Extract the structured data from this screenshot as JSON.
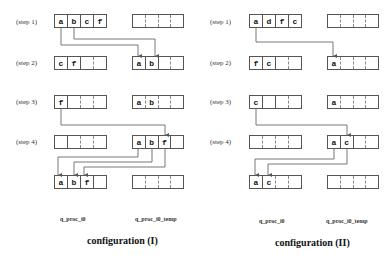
{
  "configurations": [
    {
      "title": "configuration (I)",
      "col_left": "q_proc_i0",
      "col_right": "q_proc_i0_temp",
      "steps": [
        {
          "label": "(step 1)",
          "left": [
            "a",
            "b",
            "c",
            "f"
          ],
          "right": [
            "",
            "",
            "",
            ""
          ]
        },
        {
          "label": "(step 2)",
          "left": [
            "c",
            "f",
            "",
            ""
          ],
          "right": [
            "a",
            "b",
            "",
            ""
          ]
        },
        {
          "label": "(step 3)",
          "left": [
            "f",
            "",
            "",
            ""
          ],
          "right": [
            "a",
            "b",
            "",
            ""
          ]
        },
        {
          "label": "(step 4)",
          "left": [
            "",
            "",
            "",
            ""
          ],
          "right": [
            "a",
            "b",
            "f",
            ""
          ]
        },
        {
          "label": "",
          "left": [
            "a",
            "b",
            "f",
            ""
          ],
          "right": [
            "",
            "",
            "",
            ""
          ]
        }
      ]
    },
    {
      "title": "configuration (II)",
      "col_left": "q_proc_i0",
      "col_right": "q_proc_i0_temp",
      "steps": [
        {
          "label": "(step 1)",
          "left": [
            "a",
            "d",
            "f",
            "c"
          ],
          "right": [
            "",
            "",
            "",
            ""
          ]
        },
        {
          "label": "(step 2)",
          "left": [
            "f",
            "c",
            "",
            ""
          ],
          "right": [
            "a",
            "",
            "",
            ""
          ]
        },
        {
          "label": "(step 3)",
          "left": [
            "c",
            "",
            "",
            ""
          ],
          "right": [
            "a",
            "",
            "",
            ""
          ]
        },
        {
          "label": "(step 4)",
          "left": [
            "",
            "",
            "",
            ""
          ],
          "right": [
            "a",
            "c",
            "",
            ""
          ]
        },
        {
          "label": "",
          "left": [
            "a",
            "c",
            "",
            ""
          ],
          "right": [
            "",
            "",
            "",
            ""
          ]
        }
      ]
    }
  ],
  "colors": {
    "line": "#555555",
    "text": "#111111",
    "background": "#ffffff"
  }
}
